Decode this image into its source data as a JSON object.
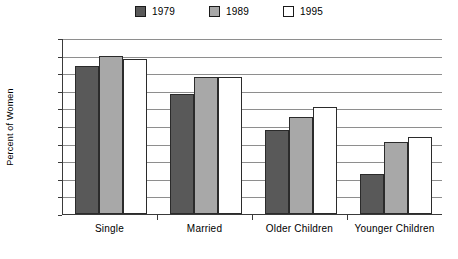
{
  "chart_data": {
    "type": "bar",
    "title": "",
    "subtitle": "",
    "xlabel": "",
    "ylabel": "Percent of Women",
    "ylim": [
      50,
      100
    ],
    "ytick_step": 5,
    "yticks": [
      100,
      95,
      90,
      85,
      80,
      75,
      70,
      65,
      60,
      55,
      50
    ],
    "grid": true,
    "legend_position": "top-center",
    "categories": [
      "Single",
      "Married",
      "Older Children",
      "Younger Children"
    ],
    "series": [
      {
        "name": "1979",
        "color": "#595959",
        "values": [
          92,
          84,
          74,
          61.5
        ]
      },
      {
        "name": "1989",
        "color": "#a8a8a8",
        "values": [
          95,
          89,
          77.5,
          70.5
        ]
      },
      {
        "name": "1995",
        "color": "#ffffff",
        "values": [
          94,
          89,
          80.5,
          72
        ]
      }
    ]
  },
  "colors": {
    "series_1979": "#595959",
    "series_1989": "#a8a8a8",
    "series_1995": "#ffffff",
    "gridline": "#8e8e8e",
    "axis": "#3a3a3a",
    "bar_outline": "#2b2b2b",
    "background": "#ffffff"
  }
}
